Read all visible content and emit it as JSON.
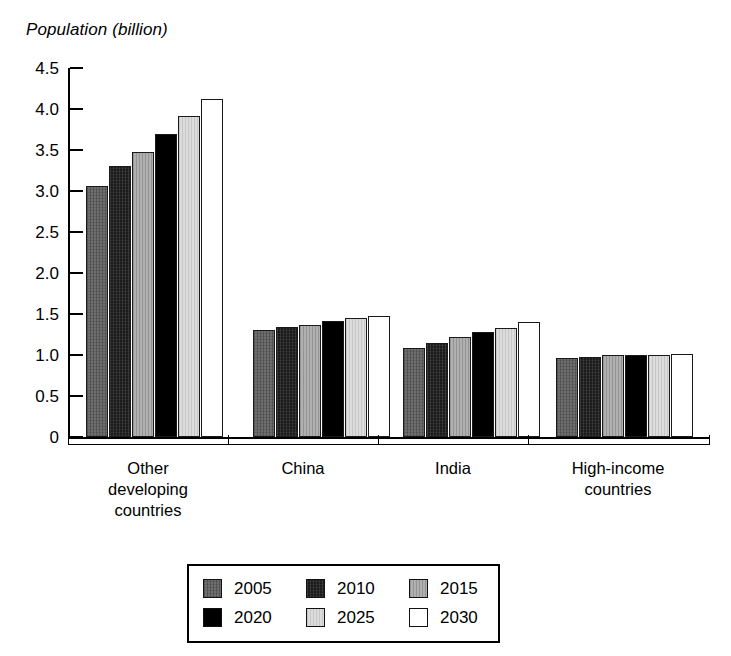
{
  "chart_data": {
    "type": "bar",
    "title": "Population (billion)",
    "xlabel": "",
    "ylabel": "Population (billion)",
    "ylim": [
      0,
      4.5
    ],
    "yticks": [
      "0",
      "0.5",
      "1.0",
      "1.5",
      "2.0",
      "2.5",
      "3.0",
      "3.5",
      "4.0",
      "4.5"
    ],
    "ytick_values": [
      0,
      0.5,
      1.0,
      1.5,
      2.0,
      2.5,
      3.0,
      3.5,
      4.0,
      4.5
    ],
    "grid": false,
    "legend_position": "bottom",
    "categories": [
      "Other\ndeveloping\ncountries",
      "China",
      "India",
      "High-income\ncountries"
    ],
    "series": [
      {
        "name": "2005",
        "color": "#6e6e6e",
        "values": [
          3.06,
          1.3,
          1.09,
          0.96
        ]
      },
      {
        "name": "2010",
        "color": "#1b1b1b",
        "values": [
          3.3,
          1.34,
          1.15,
          0.97
        ]
      },
      {
        "name": "2015",
        "color": "#b0b0b0",
        "values": [
          3.47,
          1.37,
          1.22,
          1.0
        ]
      },
      {
        "name": "2020",
        "color": "#000000",
        "values": [
          3.69,
          1.42,
          1.28,
          1.0
        ]
      },
      {
        "name": "2025",
        "color": "#dcdcdc",
        "values": [
          3.91,
          1.45,
          1.33,
          1.0
        ]
      },
      {
        "name": "2030",
        "color": "#ffffff",
        "values": [
          4.12,
          1.48,
          1.4,
          1.01
        ]
      }
    ]
  },
  "legend": {
    "rows": [
      [
        "2005",
        "2010",
        "2015"
      ],
      [
        "2020",
        "2025",
        "2030"
      ]
    ]
  }
}
